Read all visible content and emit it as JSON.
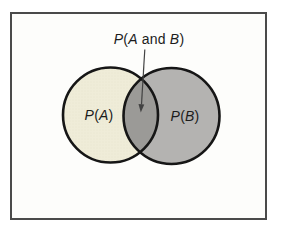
{
  "diagram": {
    "type": "venn",
    "intersection_label": {
      "p": "P",
      "open": "(",
      "a": "A",
      "and": " and ",
      "b": "B",
      "close": ")"
    },
    "circle_a_label": {
      "p": "P",
      "open": "(",
      "v": "A",
      "close": ")"
    },
    "circle_b_label": {
      "p": "P",
      "open": "(",
      "v": "B",
      "close": ")"
    }
  },
  "colors": {
    "circle_a_fill": "#efecd8",
    "circle_a_texture": "#e2ddc6",
    "circle_b_fill": "#b4b3b1",
    "intersection_fill": "#9b9a97",
    "circle_outline": "#161616",
    "frame_border": "#4a4a4a",
    "arrow": "#424242",
    "label_text": "#1c1c1c"
  }
}
